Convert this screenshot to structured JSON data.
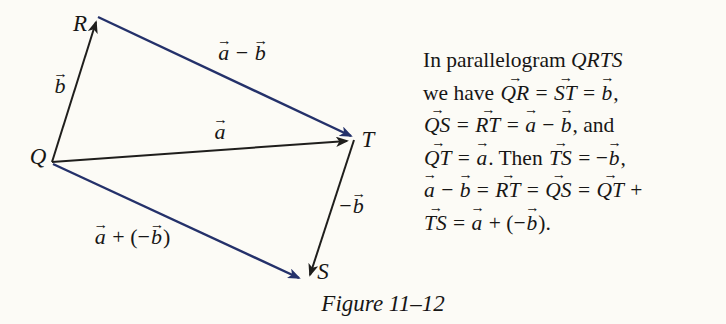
{
  "caption": "Figure 11–12",
  "colors": {
    "vector_black": "#1f1e1c",
    "vector_blue": "#24316a",
    "text": "#171615",
    "background": "#fcfbf6"
  },
  "diagram": {
    "vertices": [
      {
        "label": "Q",
        "x": 38,
        "y": 156
      },
      {
        "label": "R",
        "x": 80,
        "y": 23
      },
      {
        "label": "T",
        "x": 368,
        "y": 139
      },
      {
        "label": "S",
        "x": 323,
        "y": 271
      }
    ],
    "edges": [
      {
        "name": "vector-QR",
        "x1": 52,
        "y1": 162,
        "x2": 96,
        "y2": 22,
        "color": "black"
      },
      {
        "name": "vector-RT",
        "x1": 98,
        "y1": 17,
        "x2": 351,
        "y2": 136,
        "color": "blue"
      },
      {
        "name": "vector-QT",
        "x1": 52,
        "y1": 162,
        "x2": 347,
        "y2": 141,
        "color": "black"
      },
      {
        "name": "vector-TS",
        "x1": 354,
        "y1": 140,
        "x2": 310,
        "y2": 275,
        "color": "black"
      },
      {
        "name": "vector-QS",
        "x1": 53,
        "y1": 164,
        "x2": 299,
        "y2": 278,
        "color": "blue"
      }
    ],
    "labels": [
      {
        "name": "label-b",
        "x": 60,
        "y": 86,
        "segments": [
          {
            "t": "b",
            "s": "vec"
          }
        ]
      },
      {
        "name": "label-a-minus-b",
        "x": 242,
        "y": 53,
        "segments": [
          {
            "t": "a",
            "s": "vec"
          },
          {
            "t": " − ",
            "s": "rm"
          },
          {
            "t": "b",
            "s": "vec"
          }
        ]
      },
      {
        "name": "label-a",
        "x": 220,
        "y": 132,
        "segments": [
          {
            "t": "a",
            "s": "vec"
          }
        ]
      },
      {
        "name": "label-minus-b",
        "x": 352,
        "y": 206,
        "segments": [
          {
            "t": "−",
            "s": "rm"
          },
          {
            "t": "b",
            "s": "vec"
          }
        ]
      },
      {
        "name": "label-a-plus-neg-b",
        "x": 132,
        "y": 237,
        "segments": [
          {
            "t": "a",
            "s": "vec"
          },
          {
            "t": " + (−",
            "s": "rm"
          },
          {
            "t": "b",
            "s": "vec"
          },
          {
            "t": ")",
            "s": "rm"
          }
        ]
      }
    ]
  },
  "text_block": {
    "lines": [
      {
        "segments": [
          {
            "t": "In parallelogram ",
            "s": "rm"
          },
          {
            "t": "QRTS",
            "s": "it"
          }
        ]
      },
      {
        "segments": [
          {
            "t": "we have ",
            "s": "rm"
          },
          {
            "t": "QR",
            "s": "vec"
          },
          {
            "t": " = ",
            "s": "rm"
          },
          {
            "t": "ST",
            "s": "vec"
          },
          {
            "t": " = ",
            "s": "rm"
          },
          {
            "t": "b",
            "s": "vec"
          },
          {
            "t": ",",
            "s": "rm"
          }
        ]
      },
      {
        "segments": [
          {
            "t": "QS",
            "s": "vec"
          },
          {
            "t": " = ",
            "s": "rm"
          },
          {
            "t": "RT",
            "s": "vec"
          },
          {
            "t": " = ",
            "s": "rm"
          },
          {
            "t": "a",
            "s": "vec"
          },
          {
            "t": " − ",
            "s": "rm"
          },
          {
            "t": "b",
            "s": "vec"
          },
          {
            "t": ", and",
            "s": "rm"
          }
        ]
      },
      {
        "segments": [
          {
            "t": "QT",
            "s": "vec"
          },
          {
            "t": " = ",
            "s": "rm"
          },
          {
            "t": "a",
            "s": "vec"
          },
          {
            "t": ". Then ",
            "s": "rm"
          },
          {
            "t": "TS",
            "s": "vec"
          },
          {
            "t": " = −",
            "s": "rm"
          },
          {
            "t": "b",
            "s": "vec"
          },
          {
            "t": ",",
            "s": "rm"
          }
        ]
      },
      {
        "segments": [
          {
            "t": "a",
            "s": "vec"
          },
          {
            "t": " − ",
            "s": "rm"
          },
          {
            "t": "b",
            "s": "vec"
          },
          {
            "t": " = ",
            "s": "rm"
          },
          {
            "t": "RT",
            "s": "vec"
          },
          {
            "t": " = ",
            "s": "rm"
          },
          {
            "t": "QS",
            "s": "vec"
          },
          {
            "t": " = ",
            "s": "rm"
          },
          {
            "t": "QT",
            "s": "vec"
          },
          {
            "t": " +",
            "s": "rm"
          }
        ]
      },
      {
        "segments": [
          {
            "t": "TS",
            "s": "vec"
          },
          {
            "t": " = ",
            "s": "rm"
          },
          {
            "t": "a",
            "s": "vec"
          },
          {
            "t": " + (−",
            "s": "rm"
          },
          {
            "t": "b",
            "s": "vec"
          },
          {
            "t": ").",
            "s": "rm"
          }
        ]
      }
    ]
  }
}
